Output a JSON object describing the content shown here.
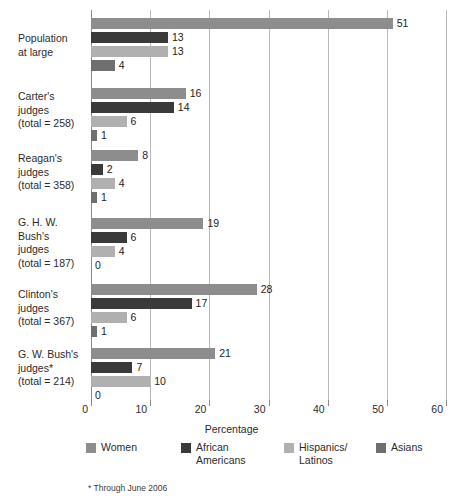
{
  "chart_data": {
    "type": "bar",
    "orientation": "horizontal",
    "title": "",
    "xlabel": "Percentage",
    "ylabel": "",
    "xlim": [
      0,
      60
    ],
    "xticks": [
      0,
      10,
      20,
      30,
      40,
      50,
      60
    ],
    "grid": true,
    "legend_position": "bottom",
    "footnote": "* Through June 2006",
    "series": [
      {
        "name": "Women",
        "color": "#8d8d8d",
        "values": [
          51,
          16,
          8,
          19,
          28,
          21
        ]
      },
      {
        "name": "African\nAmericans",
        "color": "#3a3a3a",
        "values": [
          13,
          14,
          2,
          6,
          17,
          7
        ]
      },
      {
        "name": "Hispanics/\nLatinos",
        "color": "#b0b0b0",
        "values": [
          13,
          6,
          4,
          4,
          6,
          10
        ]
      },
      {
        "name": "Asians",
        "color": "#6f6f6f",
        "values": [
          4,
          1,
          1,
          0,
          1,
          0
        ]
      }
    ],
    "categories": [
      "Population\nat large",
      "Carter's judges\n(total = 258)",
      "Reagan's judges\n(total = 358)",
      "G. H. W. Bush's\njudges\n(total = 187)",
      "Clinton's judges\n(total = 367)",
      "G. W. Bush's\njudges*\n(total = 214)"
    ]
  },
  "groups": [
    {
      "label_lines": [
        "Population",
        "at large"
      ],
      "bars": [
        {
          "series": "Women",
          "value": 51,
          "label": "51"
        },
        {
          "series": "African Americans",
          "value": 13,
          "label": "13"
        },
        {
          "series": "Hispanics/Latinos",
          "value": 13,
          "label": "13"
        },
        {
          "series": "Asians",
          "value": 4,
          "label": "4"
        }
      ]
    },
    {
      "label_lines": [
        "Carter's judges",
        "(total = 258)"
      ],
      "bars": [
        {
          "series": "Women",
          "value": 16,
          "label": "16"
        },
        {
          "series": "African Americans",
          "value": 14,
          "label": "14"
        },
        {
          "series": "Hispanics/Latinos",
          "value": 6,
          "label": "6"
        },
        {
          "series": "Asians",
          "value": 1,
          "label": "1"
        }
      ]
    },
    {
      "label_lines": [
        "Reagan's judges",
        "(total = 358)"
      ],
      "bars": [
        {
          "series": "Women",
          "value": 8,
          "label": "8"
        },
        {
          "series": "African Americans",
          "value": 2,
          "label": "2"
        },
        {
          "series": "Hispanics/Latinos",
          "value": 4,
          "label": "4"
        },
        {
          "series": "Asians",
          "value": 1,
          "label": "1"
        }
      ]
    },
    {
      "label_lines": [
        "G. H. W. Bush's",
        "judges",
        "(total = 187)"
      ],
      "bars": [
        {
          "series": "Women",
          "value": 19,
          "label": "19"
        },
        {
          "series": "African Americans",
          "value": 6,
          "label": "6"
        },
        {
          "series": "Hispanics/Latinos",
          "value": 4,
          "label": "4"
        },
        {
          "series": "Asians",
          "value": 0,
          "label": "0"
        }
      ]
    },
    {
      "label_lines": [
        "Clinton's judges",
        "(total = 367)"
      ],
      "bars": [
        {
          "series": "Women",
          "value": 28,
          "label": "28"
        },
        {
          "series": "African Americans",
          "value": 17,
          "label": "17"
        },
        {
          "series": "Hispanics/Latinos",
          "value": 6,
          "label": "6"
        },
        {
          "series": "Asians",
          "value": 1,
          "label": "1"
        }
      ]
    },
    {
      "label_lines": [
        "G. W. Bush's",
        "judges*",
        "(total = 214)"
      ],
      "bars": [
        {
          "series": "Women",
          "value": 21,
          "label": "21"
        },
        {
          "series": "African Americans",
          "value": 7,
          "label": "7"
        },
        {
          "series": "Hispanics/Latinos",
          "value": 10,
          "label": "10"
        },
        {
          "series": "Asians",
          "value": 0,
          "label": "0"
        }
      ]
    }
  ],
  "axis": {
    "title": "Percentage",
    "ticks": [
      "0",
      "10",
      "20",
      "30",
      "40",
      "50",
      "60"
    ]
  },
  "legend": {
    "items": [
      {
        "label": "Women",
        "color": "#8d8d8d",
        "key": "women"
      },
      {
        "label": "African\nAmericans",
        "color": "#3a3a3a",
        "key": "african"
      },
      {
        "label": "Hispanics/\nLatinos",
        "color": "#b0b0b0",
        "key": "hispanic"
      },
      {
        "label": "Asians",
        "color": "#6f6f6f",
        "key": "asian"
      }
    ]
  },
  "footnote": "* Through June 2006"
}
